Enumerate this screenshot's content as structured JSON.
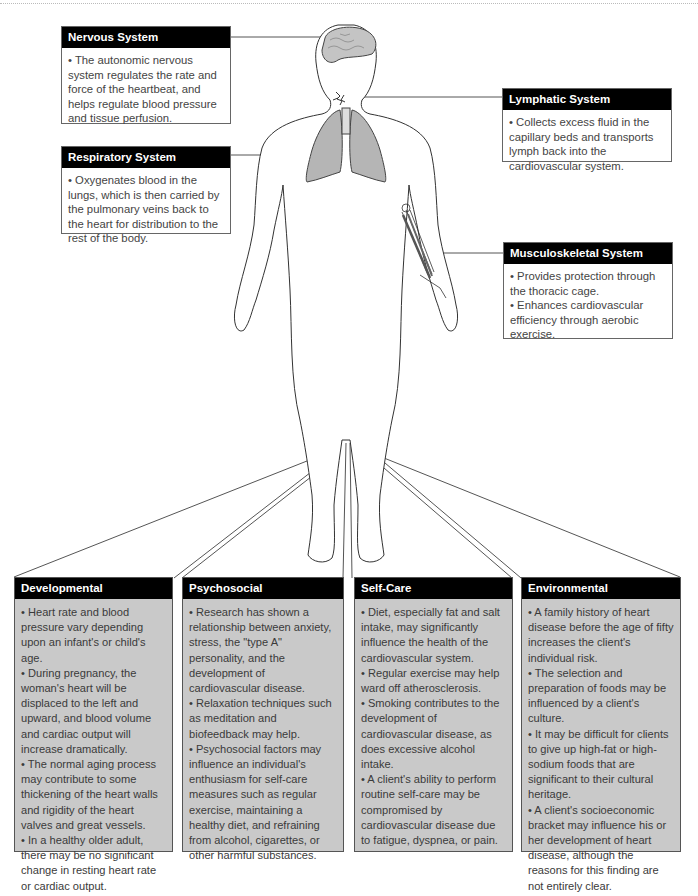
{
  "systems": {
    "nervous": {
      "title": "Nervous System",
      "bullets": [
        "• The autonomic nervous system regulates the rate and force of the heartbeat, and helps regulate blood pressure and tissue perfusion."
      ]
    },
    "lymphatic": {
      "title": "Lymphatic System",
      "bullets": [
        "• Collects excess fluid in the capillary beds and transports lymph back into the cardiovascular system."
      ]
    },
    "respiratory": {
      "title": "Respiratory System",
      "bullets": [
        "• Oxygenates blood in the lungs, which is then carried by the pulmonary veins back to the heart for distribution to the rest of the body."
      ]
    },
    "musculoskeletal": {
      "title": "Musculoskeletal System",
      "bullets": [
        "• Provides protection through the thoracic cage.",
        "• Enhances cardiovascular efficiency through aerobic exercise."
      ]
    }
  },
  "factors": {
    "developmental": {
      "title": "Developmental",
      "bullets": [
        "• Heart rate and blood pressure vary depending upon an infant's or child's age.",
        "• During pregnancy, the woman's heart will be displaced to the left and upward, and blood volume and cardiac output will increase dramatically.",
        "• The normal aging process may contribute to some thickening of the heart walls and rigidity of the heart valves and great vessels.",
        "• In a healthy older adult, there may be no significant change in resting heart rate or cardiac output."
      ]
    },
    "psychosocial": {
      "title": "Psychosocial",
      "bullets": [
        "• Research has shown a relationship between anxiety, stress, the \"type A\" personality, and the development of cardiovascular disease.",
        "• Relaxation techniques such as meditation and biofeedback may help.",
        "• Psychosocial factors may influence an individual's enthusiasm for self-care measures such as regular exercise, maintaining a healthy diet, and refraining from alcohol, cigarettes, or other harmful substances."
      ]
    },
    "selfcare": {
      "title": "Self-Care",
      "bullets": [
        "• Diet, especially fat and salt intake, may significantly influence the health of the cardiovascular system.",
        "• Regular exercise may help ward off atherosclerosis.",
        "• Smoking contributes to the development of cardiovascular disease, as does excessive alcohol intake.",
        "• A client's ability to perform routine self-care may be compromised by cardiovascular disease due to fatigue, dyspnea, or pain."
      ]
    },
    "environmental": {
      "title": "Environmental",
      "bullets": [
        "• A family history of heart disease before the age of fifty increases the client's individual risk.",
        "• The selection and preparation of foods may be influenced by a client's culture.",
        "• It may be difficult for clients to give up high-fat or high-sodium foods that are significant to their cultural heritage.",
        "• A client's socioeconomic bracket may influence his or her development of heart disease, although the reasons for this finding are not entirely clear."
      ]
    }
  },
  "colors": {
    "header_bg": "#000000",
    "factor_box_bg": "#c9c9c9",
    "organ_fill": "#b5b5b5",
    "outline": "#444444"
  }
}
